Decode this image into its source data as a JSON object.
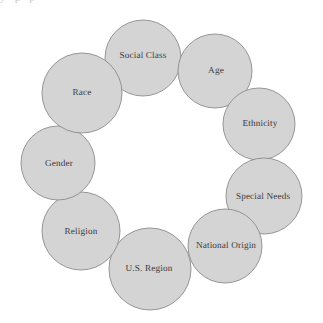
{
  "figure": {
    "type": "ring-of-circles-diagram",
    "title": "",
    "background_color": "#ffffff",
    "circle_fill_color": "#d4d4d4",
    "circle_border_color": "#8b8b8b",
    "label_text_color": "#3c3a3a",
    "top_edge_artifact": "y  p        p",
    "node_count": 9
  },
  "nodes": [
    {
      "id": "social-class",
      "label": "Social Class",
      "cx": 143,
      "cy": 58,
      "r": 38,
      "label_x": 143,
      "label_y": 55
    },
    {
      "id": "age",
      "label": "Age",
      "cx": 215,
      "cy": 71,
      "r": 37,
      "label_x": 216,
      "label_y": 70
    },
    {
      "id": "ethnicity",
      "label": "Ethnicity",
      "cx": 259,
      "cy": 124,
      "r": 36,
      "label_x": 260,
      "label_y": 123
    },
    {
      "id": "special-needs",
      "label": "Special Needs",
      "cx": 264,
      "cy": 196,
      "r": 38,
      "label_x": 263,
      "label_y": 196
    },
    {
      "id": "national-origin",
      "label": "National Origin",
      "cx": 225,
      "cy": 246,
      "r": 37,
      "label_x": 226,
      "label_y": 245
    },
    {
      "id": "us-region",
      "label": "U.S. Region",
      "cx": 150,
      "cy": 269,
      "r": 41,
      "label_x": 149,
      "label_y": 268
    },
    {
      "id": "religion",
      "label": "Religion",
      "cx": 81,
      "cy": 231,
      "r": 39,
      "label_x": 81,
      "label_y": 231
    },
    {
      "id": "gender",
      "label": "Gender",
      "cx": 58,
      "cy": 163,
      "r": 37,
      "label_x": 59,
      "label_y": 163
    },
    {
      "id": "race",
      "label": "Race",
      "cx": 82,
      "cy": 93,
      "r": 40,
      "label_x": 82,
      "label_y": 92
    }
  ]
}
